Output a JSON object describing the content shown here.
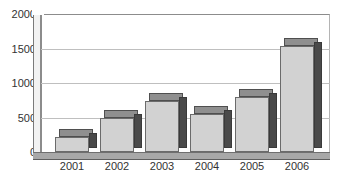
{
  "chart_data": {
    "type": "bar",
    "title": "",
    "subtitle": "",
    "xlabel": "",
    "ylabel": "",
    "categories": [
      "2001",
      "2002",
      "2003",
      "2004",
      "2005",
      "2006"
    ],
    "values": [
      220,
      490,
      740,
      550,
      800,
      1530
    ],
    "series": [
      {
        "name": "",
        "values": [
          220,
          490,
          740,
          550,
          800,
          1530
        ]
      }
    ],
    "ylim": [
      0,
      2000
    ],
    "yticks": [
      0,
      500,
      1000,
      1500,
      2000
    ],
    "ytick_labels": [
      "0",
      "500",
      "1000",
      "1500",
      "2000"
    ],
    "xtick_labels": [
      "2001",
      "2002",
      "2003",
      "2004",
      "2005",
      "2006"
    ],
    "grid": "horizontal",
    "legend": "none",
    "style": "3d-column",
    "colors": {
      "bar_front": "#d2d2d2",
      "bar_side": "#4a4a4a",
      "bar_top": "#8f8f8f",
      "gridline": "#bfbfbf",
      "axis": "#8c8c8c",
      "floor": "#a8a8a8",
      "text": "#333333",
      "background": "#ffffff"
    }
  },
  "axes": {
    "y": {
      "ticks": [
        {
          "label": "2000",
          "value": 2000
        },
        {
          "label": "1500",
          "value": 1500
        },
        {
          "label": "1000",
          "value": 1000
        },
        {
          "label": "500",
          "value": 500
        },
        {
          "label": "0",
          "value": 0
        }
      ]
    },
    "x": {
      "ticks": [
        {
          "label": "2001"
        },
        {
          "label": "2002"
        },
        {
          "label": "2003"
        },
        {
          "label": "2004"
        },
        {
          "label": "2005"
        },
        {
          "label": "2006"
        }
      ]
    }
  }
}
